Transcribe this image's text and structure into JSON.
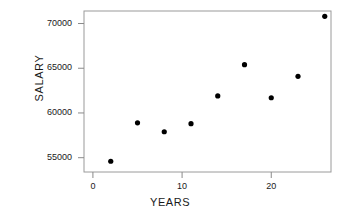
{
  "chart_data": {
    "type": "scatter",
    "title": "",
    "xlabel": "YEARS",
    "ylabel": "SALARY",
    "xlim": [
      -1,
      26.7
    ],
    "ylim": [
      53400,
      71400
    ],
    "grid": false,
    "legend": null,
    "xticks": [
      0,
      10,
      20
    ],
    "xtick_labels": [
      "0",
      "10",
      "20"
    ],
    "yticks": [
      55000,
      60000,
      65000,
      70000
    ],
    "ytick_labels": [
      "55000",
      "60000",
      "65000",
      "70000"
    ],
    "marker": "filled-circle",
    "marker_color": "#000000",
    "points": [
      {
        "x": 2,
        "y": 54600
      },
      {
        "x": 5,
        "y": 58900
      },
      {
        "x": 8,
        "y": 57900
      },
      {
        "x": 11,
        "y": 58800
      },
      {
        "x": 14,
        "y": 61900
      },
      {
        "x": 17,
        "y": 65400
      },
      {
        "x": 20,
        "y": 61700
      },
      {
        "x": 23,
        "y": 64100
      },
      {
        "x": 26,
        "y": 70800
      }
    ],
    "x": [
      2,
      5,
      8,
      11,
      14,
      17,
      20,
      23,
      26
    ],
    "values": [
      54600,
      58900,
      57900,
      58800,
      61900,
      65400,
      61700,
      64100,
      70800
    ]
  },
  "axes": {
    "frame_color": "#9a9a9a",
    "tick_color": "#8a8a8a"
  }
}
